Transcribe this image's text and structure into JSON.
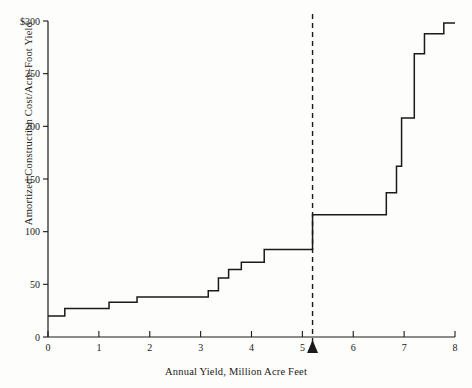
{
  "chart_data": {
    "type": "line",
    "subtype": "step",
    "title": "",
    "xlabel": "Annual Yield, Million Acre Feet",
    "ylabel": "Amortized Construction Cost/Acre-Foot Yield",
    "xlim": [
      0,
      8
    ],
    "ylim": [
      0,
      300
    ],
    "xticks": [
      0,
      1,
      2,
      3,
      4,
      5,
      6,
      7,
      8
    ],
    "xticklabels": [
      "0",
      "1",
      "2",
      "3",
      "4",
      "5",
      "6",
      "7",
      "8"
    ],
    "yticks": [
      0,
      50,
      100,
      150,
      200,
      250,
      300
    ],
    "yticklabels": [
      "0",
      "50",
      "100",
      "150",
      "200",
      "250",
      "$300"
    ],
    "grid": false,
    "legend": null,
    "annotations": [
      {
        "name": "reference-line",
        "type": "vertical-dashed-line",
        "x": 5.2
      },
      {
        "name": "axis-marker-triangle",
        "type": "triangle-marker",
        "x": 5.2
      }
    ],
    "series": [
      {
        "name": "Amortized construction cost per acre-foot yield",
        "steps": [
          {
            "x": 0.0,
            "y": 20
          },
          {
            "x": 0.33,
            "y": 27
          },
          {
            "x": 1.2,
            "y": 33
          },
          {
            "x": 1.75,
            "y": 38
          },
          {
            "x": 3.15,
            "y": 44
          },
          {
            "x": 3.35,
            "y": 56
          },
          {
            "x": 3.55,
            "y": 64
          },
          {
            "x": 3.8,
            "y": 71
          },
          {
            "x": 4.25,
            "y": 83
          },
          {
            "x": 5.2,
            "y": 116
          },
          {
            "x": 6.65,
            "y": 137
          },
          {
            "x": 6.85,
            "y": 162
          },
          {
            "x": 6.95,
            "y": 208
          },
          {
            "x": 7.2,
            "y": 269
          },
          {
            "x": 7.4,
            "y": 288
          },
          {
            "x": 7.78,
            "y": 298
          },
          {
            "x": 8.0,
            "y": 298
          }
        ]
      }
    ]
  }
}
